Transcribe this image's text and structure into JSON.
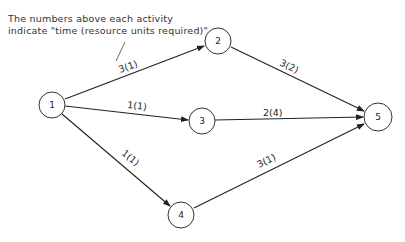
{
  "note": {
    "line1": "The numbers above each activity",
    "line2": "indicate \"time (resource units required)\""
  },
  "nodes": [
    {
      "id": "1",
      "label": "1",
      "cx": 52,
      "cy": 105
    },
    {
      "id": "2",
      "label": "2",
      "cx": 218,
      "cy": 41
    },
    {
      "id": "3",
      "label": "3",
      "cx": 202,
      "cy": 121
    },
    {
      "id": "4",
      "label": "4",
      "cx": 181,
      "cy": 215
    },
    {
      "id": "5",
      "label": "5",
      "cx": 378,
      "cy": 117
    }
  ],
  "edges": [
    {
      "from": "1",
      "to": "2",
      "label": "3(1)",
      "time": 3,
      "resources": 1
    },
    {
      "from": "1",
      "to": "3",
      "label": "1(1)",
      "time": 1,
      "resources": 1
    },
    {
      "from": "1",
      "to": "4",
      "label": "1(1)",
      "time": 1,
      "resources": 1
    },
    {
      "from": "2",
      "to": "5",
      "label": "3(2)",
      "time": 3,
      "resources": 2
    },
    {
      "from": "3",
      "to": "5",
      "label": "2(4)",
      "time": 2,
      "resources": 4
    },
    {
      "from": "4",
      "to": "5",
      "label": "3(1)",
      "time": 3,
      "resources": 1
    }
  ]
}
